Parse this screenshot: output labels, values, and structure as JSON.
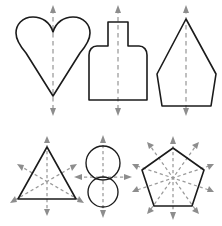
{
  "figure": {
    "background_color": "#ffffff",
    "outline_color": "#1b1b1b",
    "axis_color": "#9a9a9a",
    "arrow_color": "#8d8d8d",
    "width": 222,
    "height": 226,
    "rows": 2,
    "columns": 3
  },
  "shapes": [
    {
      "id": "heart",
      "name": "Heart",
      "row": 1,
      "column": 1,
      "axis_count": 1,
      "axis_orientation": "vertical",
      "arrow_count": 2,
      "arrow_directions": [
        "up",
        "down"
      ]
    },
    {
      "id": "bottle",
      "name": "Bottle",
      "row": 1,
      "column": 2,
      "axis_count": 1,
      "axis_orientation": "vertical",
      "arrow_count": 2,
      "arrow_directions": [
        "up",
        "down"
      ]
    },
    {
      "id": "kite-pentagon",
      "name": "Kite Pentagon",
      "row": 1,
      "column": 3,
      "axis_count": 1,
      "axis_orientation": "vertical",
      "arrow_count": 2,
      "arrow_directions": [
        "up",
        "down"
      ]
    },
    {
      "id": "triangle",
      "name": "Equilateral Triangle",
      "row": 2,
      "column": 1,
      "axis_count": 3,
      "axis_orientation": "radial",
      "arrow_count": 6,
      "arrow_directions": [
        "up",
        "down",
        "upper-left",
        "lower-right",
        "upper-right",
        "lower-left"
      ]
    },
    {
      "id": "figure-eight",
      "name": "Figure Eight",
      "row": 2,
      "column": 2,
      "axis_count": 2,
      "axis_orientation": "vertical-and-horizontal",
      "arrow_count": 4,
      "arrow_directions": [
        "up",
        "down",
        "left",
        "right"
      ]
    },
    {
      "id": "regular-pentagon",
      "name": "Regular Pentagon",
      "row": 2,
      "column": 3,
      "axis_count": 5,
      "axis_orientation": "radial",
      "arrow_count": 10,
      "arrow_directions": [
        "up",
        "down",
        "upper-left",
        "upper-right",
        "lower-left",
        "lower-right",
        "left-upper",
        "left-lower",
        "right-upper",
        "right-lower"
      ]
    }
  ]
}
